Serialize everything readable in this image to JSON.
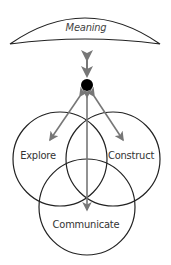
{
  "diagram": {
    "top_label": "Meaning",
    "circles": [
      {
        "label": "Explore"
      },
      {
        "label": "Construct"
      },
      {
        "label": "Communicate"
      }
    ],
    "colors": {
      "stroke": "#222222",
      "arrow": "#777777",
      "dot": "#000000"
    }
  }
}
